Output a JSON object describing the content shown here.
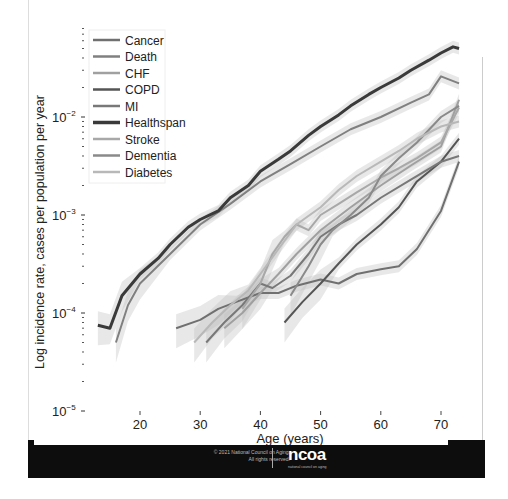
{
  "chart_data": {
    "type": "line",
    "title": "",
    "xlabel": "Age (years)",
    "ylabel": "Log incidence rate, cases per population per year",
    "yscale": "log",
    "xlim": [
      12,
      75
    ],
    "ylim": [
      1e-05,
      0.08
    ],
    "xticks": [
      20,
      30,
      40,
      50,
      60,
      70
    ],
    "yticks": [
      {
        "value": 0.01,
        "label": "10",
        "exp": "−2"
      },
      {
        "value": 0.001,
        "label": "10",
        "exp": "−3"
      },
      {
        "value": 0.0001,
        "label": "10",
        "exp": "−4"
      },
      {
        "value": 1e-05,
        "label": "10",
        "exp": "−5"
      }
    ],
    "grid": false,
    "legend_position": "upper left",
    "series": [
      {
        "name": "Cancer",
        "color": "#707070",
        "width": 2,
        "points": [
          [
            26,
            7e-05
          ],
          [
            30,
            8.5e-05
          ],
          [
            33,
            0.00011
          ],
          [
            36,
            0.00013
          ],
          [
            40,
            0.00016
          ],
          [
            43,
            0.00016
          ],
          [
            46,
            0.00019
          ],
          [
            50,
            0.00022
          ],
          [
            53,
            0.0002
          ],
          [
            56,
            0.00025
          ],
          [
            60,
            0.00028
          ],
          [
            63,
            0.0003
          ],
          [
            66,
            0.00045
          ],
          [
            70,
            0.0011
          ],
          [
            73,
            0.0035
          ]
        ]
      },
      {
        "name": "Death",
        "color": "#808080",
        "width": 2,
        "points": [
          [
            16,
            5e-05
          ],
          [
            18,
            0.00012
          ],
          [
            20,
            0.0002
          ],
          [
            25,
            0.0004
          ],
          [
            30,
            0.0008
          ],
          [
            35,
            0.0013
          ],
          [
            40,
            0.0022
          ],
          [
            45,
            0.0033
          ],
          [
            50,
            0.005
          ],
          [
            55,
            0.0075
          ],
          [
            60,
            0.01
          ],
          [
            65,
            0.014
          ],
          [
            68,
            0.017
          ],
          [
            70,
            0.026
          ],
          [
            73,
            0.022
          ]
        ]
      },
      {
        "name": "CHF",
        "color": "#a0a0a0",
        "width": 2,
        "points": [
          [
            34,
            7e-05
          ],
          [
            37,
            0.0001
          ],
          [
            40,
            0.00016
          ],
          [
            43,
            0.00025
          ],
          [
            46,
            0.0004
          ],
          [
            50,
            0.0007
          ],
          [
            55,
            0.0012
          ],
          [
            60,
            0.002
          ],
          [
            65,
            0.0032
          ],
          [
            70,
            0.005
          ],
          [
            73,
            0.015
          ]
        ]
      },
      {
        "name": "COPD",
        "color": "#555555",
        "width": 2,
        "points": [
          [
            44,
            8e-05
          ],
          [
            47,
            0.00013
          ],
          [
            50,
            0.0002
          ],
          [
            53,
            0.00032
          ],
          [
            56,
            0.0005
          ],
          [
            60,
            0.0008
          ],
          [
            63,
            0.0012
          ],
          [
            66,
            0.0022
          ],
          [
            70,
            0.0035
          ],
          [
            73,
            0.006
          ]
        ]
      },
      {
        "name": "MI",
        "color": "#787878",
        "width": 2,
        "points": [
          [
            31,
            5e-05
          ],
          [
            34,
            8e-05
          ],
          [
            37,
            0.00012
          ],
          [
            40,
            0.0002
          ],
          [
            42,
            0.00018
          ],
          [
            45,
            0.00024
          ],
          [
            48,
            0.0004
          ],
          [
            50,
            0.0006
          ],
          [
            53,
            0.0008
          ],
          [
            56,
            0.001
          ],
          [
            60,
            0.0015
          ],
          [
            65,
            0.0023
          ],
          [
            70,
            0.0035
          ],
          [
            73,
            0.004
          ]
        ]
      },
      {
        "name": "Healthspan",
        "color": "#3a3a3a",
        "width": 3,
        "points": [
          [
            13,
            7.5e-05
          ],
          [
            15,
            7e-05
          ],
          [
            17,
            0.00015
          ],
          [
            20,
            0.00025
          ],
          [
            23,
            0.00036
          ],
          [
            25,
            0.0005
          ],
          [
            28,
            0.00075
          ],
          [
            30,
            0.0009
          ],
          [
            33,
            0.0011
          ],
          [
            35,
            0.0015
          ],
          [
            38,
            0.002
          ],
          [
            40,
            0.0028
          ],
          [
            43,
            0.0037
          ],
          [
            45,
            0.0045
          ],
          [
            48,
            0.0065
          ],
          [
            50,
            0.008
          ],
          [
            53,
            0.0105
          ],
          [
            55,
            0.013
          ],
          [
            58,
            0.017
          ],
          [
            60,
            0.02
          ],
          [
            63,
            0.025
          ],
          [
            65,
            0.03
          ],
          [
            68,
            0.038
          ],
          [
            70,
            0.045
          ],
          [
            72,
            0.052
          ],
          [
            73,
            0.05
          ]
        ]
      },
      {
        "name": "Stroke",
        "color": "#a8a8a8",
        "width": 2,
        "points": [
          [
            37,
            0.00011
          ],
          [
            40,
            0.0002
          ],
          [
            42,
            0.0004
          ],
          [
            44,
            0.0006
          ],
          [
            46,
            0.0008
          ],
          [
            48,
            0.0007
          ],
          [
            50,
            0.001
          ],
          [
            53,
            0.0013
          ],
          [
            56,
            0.0017
          ],
          [
            60,
            0.0024
          ],
          [
            63,
            0.003
          ],
          [
            66,
            0.0038
          ],
          [
            70,
            0.0055
          ],
          [
            73,
            0.0125
          ]
        ]
      },
      {
        "name": "Dementia",
        "color": "#8a8a8a",
        "width": 2,
        "points": [
          [
            45,
            0.00015
          ],
          [
            48,
            0.0003
          ],
          [
            50,
            0.0005
          ],
          [
            52,
            0.0007
          ],
          [
            55,
            0.001
          ],
          [
            58,
            0.0015
          ],
          [
            60,
            0.0025
          ],
          [
            63,
            0.0038
          ],
          [
            66,
            0.0055
          ],
          [
            70,
            0.01
          ],
          [
            73,
            0.013
          ]
        ]
      },
      {
        "name": "Diabetes",
        "color": "#b8b8b8",
        "width": 2,
        "points": [
          [
            29,
            5e-05
          ],
          [
            32,
            8e-05
          ],
          [
            35,
            0.00012
          ],
          [
            38,
            0.00017
          ],
          [
            40,
            0.00025
          ],
          [
            43,
            0.00045
          ],
          [
            46,
            0.0008
          ],
          [
            50,
            0.0012
          ],
          [
            53,
            0.0018
          ],
          [
            56,
            0.0025
          ],
          [
            60,
            0.0035
          ],
          [
            63,
            0.0045
          ],
          [
            66,
            0.006
          ],
          [
            70,
            0.008
          ],
          [
            73,
            0.009
          ]
        ]
      }
    ]
  },
  "footer": {
    "copyright_line1": "© 2021 National Council on Aging.",
    "copyright_line2": "All rights reserved.",
    "logo": "ncoa",
    "logo_tagline": "national council on aging"
  }
}
